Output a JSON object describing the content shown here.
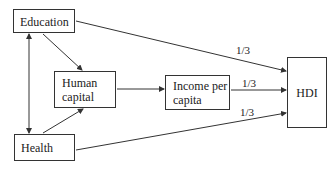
{
  "nodes": {
    "education": {
      "label": "Education"
    },
    "human_capital": {
      "line1": "Human",
      "line2": "capital"
    },
    "income_per_capita": {
      "line1": "Income per",
      "line2": "capita"
    },
    "hdi": {
      "label": "HDI"
    },
    "health": {
      "label": "Health"
    }
  },
  "edges": [
    {
      "from": "Education",
      "to": "Health",
      "type": "bidirectional"
    },
    {
      "from": "Education",
      "to": "Human capital"
    },
    {
      "from": "Health",
      "to": "Human capital"
    },
    {
      "from": "Human capital",
      "to": "Income per capita"
    },
    {
      "from": "Education",
      "to": "HDI",
      "weight": "1/3"
    },
    {
      "from": "Income per capita",
      "to": "HDI",
      "weight": "1/3"
    },
    {
      "from": "Health",
      "to": "HDI",
      "weight": "1/3"
    }
  ],
  "weights": {
    "education_hdi": "1/3",
    "income_hdi": "1/3",
    "health_hdi": "1/3"
  }
}
